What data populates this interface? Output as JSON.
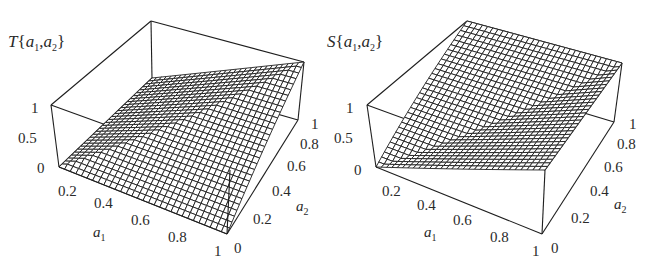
{
  "chart_data": [
    {
      "type": "surface3d",
      "id": "left",
      "title": "T{a1,a2}",
      "function": "min(a1, a2)",
      "xlabel": "a1",
      "ylabel": "a2",
      "zlabel": "T{a1,a2}",
      "x_ticks": [
        "0.2",
        "0.4",
        "0.6",
        "0.8",
        "1"
      ],
      "y_ticks": [
        "0",
        "0.2",
        "0.4",
        "0.6",
        "0.8",
        "1"
      ],
      "z_ticks": [
        "0",
        "0.5",
        "1"
      ],
      "xlim": [
        0,
        1
      ],
      "ylim": [
        0,
        1
      ],
      "zlim": [
        0,
        1
      ],
      "mesh_divisions": 30,
      "corner_values": {
        "a1=0,a2=0": 0,
        "a1=1,a2=0": 0,
        "a1=0,a2=1": 0,
        "a1=1,a2=1": 1
      }
    },
    {
      "type": "surface3d",
      "id": "right",
      "title": "S{a1,a2}",
      "function": "max(a1, a2)",
      "xlabel": "a1",
      "ylabel": "a2",
      "zlabel": "S{a1,a2}",
      "x_ticks": [
        "0.2",
        "0.4",
        "0.6",
        "0.8",
        "1"
      ],
      "y_ticks": [
        "0",
        "0.2",
        "0.4",
        "0.6",
        "0.8",
        "1"
      ],
      "z_ticks": [
        "0",
        "0.5",
        "1"
      ],
      "xlim": [
        0,
        1
      ],
      "ylim": [
        0,
        1
      ],
      "zlim": [
        0,
        1
      ],
      "mesh_divisions": 30,
      "corner_values": {
        "a1=0,a2=0": 0,
        "a1=1,a2=0": 1,
        "a1=0,a2=1": 1,
        "a1=1,a2=1": 1
      }
    }
  ],
  "plots": {
    "left": {
      "title_letter": "T",
      "title_open": "{",
      "title_a": "a",
      "title_sub1": "1",
      "title_comma": ",",
      "title_sub2": "2",
      "title_close": "}",
      "axis_a1_letter": "a",
      "axis_a1_sub": "1",
      "axis_a2_letter": "a",
      "axis_a2_sub": "2",
      "z_ticks": [
        "1",
        "0.5",
        "0"
      ],
      "a1_ticks": [
        "0.2",
        "0.4",
        "0.6",
        "0.8",
        "1"
      ],
      "a2_ticks": [
        "1",
        "0.8",
        "0.6",
        "0.4",
        "0.2",
        "0"
      ]
    },
    "right": {
      "title_letter": "S",
      "title_open": "{",
      "title_a": "a",
      "title_sub1": "1",
      "title_comma": ",",
      "title_sub2": "2",
      "title_close": "}",
      "axis_a1_letter": "a",
      "axis_a1_sub": "1",
      "axis_a2_letter": "a",
      "axis_a2_sub": "2",
      "z_ticks": [
        "1",
        "0.5",
        "0"
      ],
      "a1_ticks": [
        "0.2",
        "0.4",
        "0.6",
        "0.8",
        "1"
      ],
      "a2_ticks": [
        "1",
        "0.8",
        "0.6",
        "0.4",
        "0.2",
        "0"
      ]
    }
  },
  "colors": {
    "line": "#1e1e1e",
    "mesh_fill": "#ffffff",
    "background": "#ffffff"
  }
}
